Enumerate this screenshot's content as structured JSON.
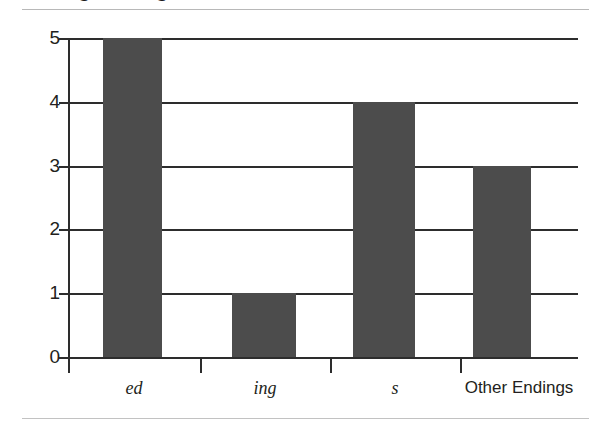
{
  "figure": {
    "cropped_title": "Adding Endings to Base Words",
    "bar_color": "#4c4c4c",
    "axis_color": "#2d2d2d",
    "rule_color": "#b8b8b8"
  },
  "chart_data": {
    "type": "bar",
    "title": "",
    "xlabel": "",
    "ylabel": "",
    "categories": [
      "ed",
      "ing",
      "s",
      "Other Endings"
    ],
    "category_styles": [
      "italic",
      "italic",
      "italic",
      "normal"
    ],
    "values": [
      5,
      1,
      4,
      3
    ],
    "ylim": [
      0,
      5
    ],
    "yticks": [
      0,
      1,
      2,
      3,
      4,
      5
    ],
    "ytick_labels": [
      "0",
      "1",
      "2",
      "3",
      "4",
      "5"
    ],
    "grid": true,
    "grid_axis": "y",
    "legend": "none"
  }
}
